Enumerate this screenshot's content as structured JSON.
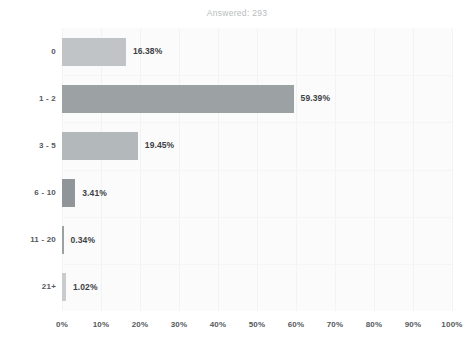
{
  "chart_data": {
    "type": "bar",
    "orientation": "horizontal",
    "title": "Answered: 293",
    "xlabel": "",
    "ylabel": "",
    "categories": [
      "0",
      "1 - 2",
      "3 - 5",
      "6 - 10",
      "11 - 20",
      "21+"
    ],
    "values": [
      16.38,
      59.39,
      19.45,
      3.41,
      0.34,
      1.02
    ],
    "value_labels": [
      "16.38%",
      "59.39%",
      "19.45%",
      "3.41%",
      "0.34%",
      "1.02%"
    ],
    "bar_colors": [
      "#c0c4c7",
      "#9ca1a4",
      "#b3b8bb",
      "#8f9598",
      "#9ca1a4",
      "#c8ccce"
    ],
    "xlim": [
      0,
      100
    ],
    "xtick_values": [
      0,
      10,
      20,
      30,
      40,
      50,
      60,
      70,
      80,
      90,
      100
    ],
    "xtick_labels": [
      "0%",
      "10%",
      "20%",
      "30%",
      "40%",
      "50%",
      "60%",
      "70%",
      "80%",
      "90%",
      "100%"
    ],
    "grid": true,
    "legend": false,
    "plot_background": "#fbfbfc",
    "title_color": "#b9bcbe",
    "tick_label_color": "#55595c",
    "value_label_color": "#3d4144"
  }
}
